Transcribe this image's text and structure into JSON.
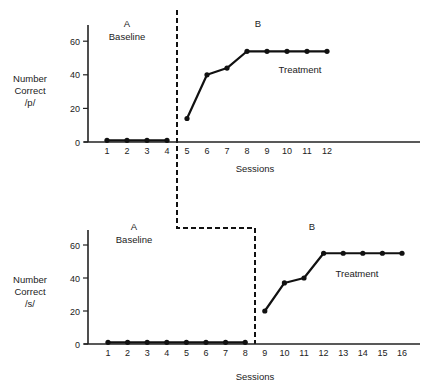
{
  "chart_data": [
    {
      "type": "line",
      "title": "",
      "ylabel": "Number Correct /p/",
      "ylabel_lines": [
        "Number",
        "Correct",
        "/p/"
      ],
      "xlabel": "Sessions",
      "ylim": [
        0,
        70
      ],
      "yticks": [
        0,
        20,
        40,
        60
      ],
      "xticks": [
        1,
        2,
        3,
        4,
        5,
        6,
        7,
        8,
        9,
        10,
        11,
        12
      ],
      "grid": false,
      "phase_change_after_session": 4,
      "phases": [
        {
          "letter": "A",
          "label": "Baseline",
          "sessions": [
            1,
            2,
            3,
            4
          ],
          "values": [
            1,
            1,
            1,
            1
          ]
        },
        {
          "letter": "B",
          "label": "Treatment",
          "sessions": [
            5,
            6,
            7,
            8,
            9,
            10,
            11,
            12
          ],
          "values": [
            14,
            40,
            44,
            54,
            54,
            54,
            54,
            54
          ]
        }
      ]
    },
    {
      "type": "line",
      "title": "",
      "ylabel": "Number Correct /s/",
      "ylabel_lines": [
        "Number",
        "Correct",
        "/s/"
      ],
      "xlabel": "Sessions",
      "ylim": [
        0,
        70
      ],
      "yticks": [
        0,
        20,
        40,
        60
      ],
      "xticks": [
        1,
        2,
        3,
        4,
        5,
        6,
        7,
        8,
        9,
        10,
        11,
        12,
        13,
        14,
        15,
        16
      ],
      "grid": false,
      "phase_change_after_session": 8,
      "phases": [
        {
          "letter": "A",
          "label": "Baseline",
          "sessions": [
            1,
            2,
            3,
            4,
            5,
            6,
            7,
            8
          ],
          "values": [
            1,
            1,
            1,
            1,
            1,
            1,
            1,
            1
          ]
        },
        {
          "letter": "B",
          "label": "Treatment",
          "sessions": [
            9,
            10,
            11,
            12,
            13,
            14,
            15,
            16
          ],
          "values": [
            20,
            37,
            40,
            55,
            55,
            55,
            55,
            55
          ]
        }
      ]
    }
  ],
  "colors": {
    "line": "#111111",
    "axis": "#222222",
    "text": "#222222",
    "background": "#ffffff"
  }
}
